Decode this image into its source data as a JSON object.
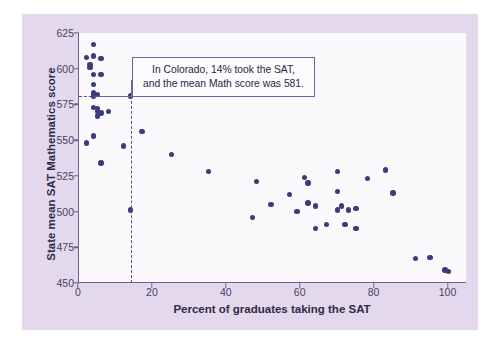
{
  "chart_data": {
    "type": "scatter",
    "title": "",
    "xlabel": "Percent of graduates taking the SAT",
    "ylabel": "State mean SAT Mathematics score",
    "xlim": [
      0,
      105
    ],
    "ylim": [
      450,
      625
    ],
    "xticks": [
      0,
      20,
      40,
      60,
      80,
      100
    ],
    "yticks": [
      450,
      475,
      500,
      525,
      550,
      575,
      600,
      625
    ],
    "grid": false,
    "legend": null,
    "annotations": [
      {
        "name": "colorado-callout",
        "text_line1": "In Colorado, 14% took the SAT,",
        "text_line2": "and the mean Math score was 581.",
        "points_to_x": 14,
        "points_to_y": 581,
        "guide_lines": "dashed leader from y-axis at 581 and from x-axis at 14"
      }
    ],
    "points": [
      {
        "x": 4,
        "y": 617
      },
      {
        "x": 2,
        "y": 608
      },
      {
        "x": 4,
        "y": 609
      },
      {
        "x": 6,
        "y": 607
      },
      {
        "x": 3,
        "y": 603
      },
      {
        "x": 3,
        "y": 601
      },
      {
        "x": 4,
        "y": 596
      },
      {
        "x": 6,
        "y": 596
      },
      {
        "x": 4,
        "y": 589
      },
      {
        "x": 4,
        "y": 583
      },
      {
        "x": 5,
        "y": 582
      },
      {
        "x": 4,
        "y": 581
      },
      {
        "x": 14,
        "y": 581
      },
      {
        "x": 4,
        "y": 573
      },
      {
        "x": 5,
        "y": 572
      },
      {
        "x": 5,
        "y": 570
      },
      {
        "x": 6,
        "y": 569
      },
      {
        "x": 8,
        "y": 570
      },
      {
        "x": 5,
        "y": 567
      },
      {
        "x": 4,
        "y": 553
      },
      {
        "x": 2,
        "y": 548
      },
      {
        "x": 12,
        "y": 546
      },
      {
        "x": 6,
        "y": 534
      },
      {
        "x": 17,
        "y": 556
      },
      {
        "x": 25,
        "y": 540
      },
      {
        "x": 14,
        "y": 501
      },
      {
        "x": 35,
        "y": 528
      },
      {
        "x": 48,
        "y": 521
      },
      {
        "x": 47,
        "y": 496
      },
      {
        "x": 52,
        "y": 505
      },
      {
        "x": 57,
        "y": 512
      },
      {
        "x": 59,
        "y": 500
      },
      {
        "x": 61,
        "y": 524
      },
      {
        "x": 62,
        "y": 520
      },
      {
        "x": 62,
        "y": 506
      },
      {
        "x": 64,
        "y": 504
      },
      {
        "x": 64,
        "y": 488
      },
      {
        "x": 67,
        "y": 491
      },
      {
        "x": 70,
        "y": 528
      },
      {
        "x": 70,
        "y": 514
      },
      {
        "x": 71,
        "y": 504
      },
      {
        "x": 70,
        "y": 501
      },
      {
        "x": 72,
        "y": 491
      },
      {
        "x": 73,
        "y": 501
      },
      {
        "x": 75,
        "y": 502
      },
      {
        "x": 75,
        "y": 488
      },
      {
        "x": 78,
        "y": 523
      },
      {
        "x": 83,
        "y": 529
      },
      {
        "x": 85,
        "y": 513
      },
      {
        "x": 91,
        "y": 467
      },
      {
        "x": 95,
        "y": 468
      },
      {
        "x": 99,
        "y": 459
      },
      {
        "x": 100,
        "y": 458
      }
    ]
  },
  "colors": {
    "panel_background": "#e4d9ec",
    "plot_background": "#fbf9fc",
    "point": "#3b3b7d",
    "axis": "#6b6190",
    "callout_border": "#6b62a8",
    "tick_text": "#463f66",
    "axis_title_text": "#2e2a48"
  }
}
